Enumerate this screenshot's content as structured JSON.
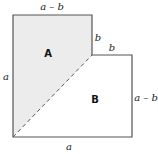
{
  "diagram": {
    "shape": "L-shaped region (square of side a with b×b corner removed)",
    "regions": [
      {
        "id": "A",
        "label": "A",
        "fill": "#ececec"
      },
      {
        "id": "B",
        "label": "B",
        "fill": "#ffffff"
      }
    ],
    "edge_labels": {
      "top": "a – b",
      "notch_vertical": "b",
      "notch_horizontal": "b",
      "left": "a",
      "right": "a – b",
      "bottom": "a"
    },
    "divider": {
      "style": "dashed",
      "from": "bottom-left corner",
      "to": "inner notch corner"
    },
    "colors": {
      "stroke": "#555555",
      "shaded": "#ececec"
    }
  }
}
